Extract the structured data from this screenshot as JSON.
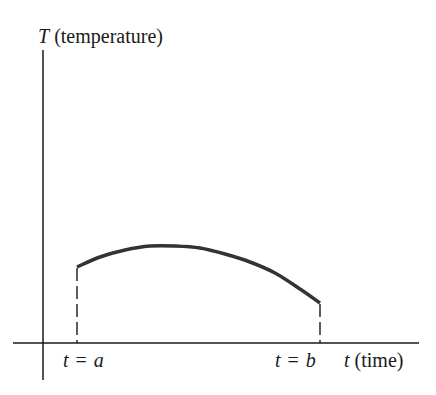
{
  "diagram": {
    "title": "",
    "y_axis": {
      "symbol": "T",
      "label": "(temperature)"
    },
    "x_axis": {
      "symbol": "t",
      "label": "(time)"
    },
    "markers": [
      {
        "var": "t",
        "eq": "=",
        "value": "a"
      },
      {
        "var": "t",
        "eq": "=",
        "value": "b"
      }
    ],
    "curve": {
      "description": "Temperature curve T(t) defined on interval from t = a to t = b; rises slightly to a maximum then decreases",
      "color": "#333333",
      "points": [
        [
          77,
          267
        ],
        [
          100,
          257
        ],
        [
          125,
          250
        ],
        [
          150,
          246
        ],
        [
          175,
          246
        ],
        [
          200,
          248
        ],
        [
          225,
          254
        ],
        [
          250,
          262
        ],
        [
          275,
          273
        ],
        [
          300,
          289
        ],
        [
          320,
          303
        ]
      ]
    },
    "colors": {
      "axis": "#1a1a1a",
      "curve": "#333333",
      "dashed": "#1a1a1a",
      "background": "#ffffff"
    }
  }
}
